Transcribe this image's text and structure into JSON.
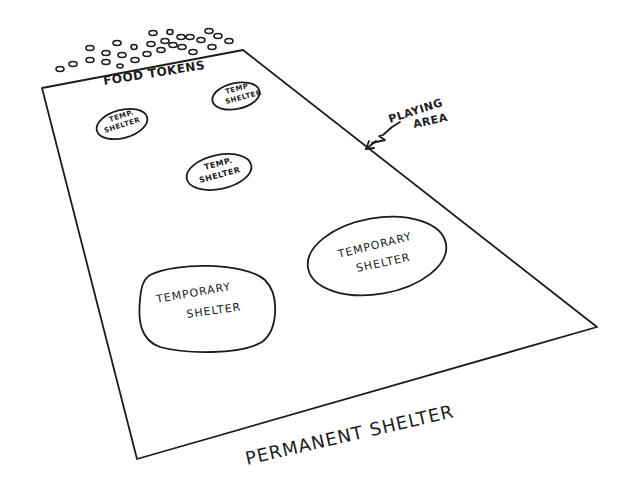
{
  "diagram": {
    "type": "hand-drawn game layout sketch",
    "ink_color": "#1c1c1c",
    "background_color": "#ffffff",
    "labels": {
      "food_tokens": "FOOD TOKENS",
      "playing_area_line1": "PLAYING",
      "playing_area_line2": "AREA",
      "permanent_shelter": "PERMANENT SHELTER"
    },
    "playing_area": {
      "corners": {
        "top_left": [
          42,
          88
        ],
        "top_right": [
          243,
          50
        ],
        "bottom_right": [
          597,
          327
        ],
        "bottom_left": [
          137,
          459
        ]
      }
    },
    "shelters": [
      {
        "id": "temp-shelter-small-left",
        "line1": "TEMP.",
        "line2": "SHELTER",
        "size": "small"
      },
      {
        "id": "temp-shelter-small-right",
        "line1": "TEMP",
        "line2": "SHELTER",
        "size": "small"
      },
      {
        "id": "temp-shelter-small-center",
        "line1": "TEMP.",
        "line2": "SHELTER",
        "size": "small"
      },
      {
        "id": "temporary-shelter-large-right",
        "line1": "TEMPORARY",
        "line2": "SHELTER",
        "size": "large"
      },
      {
        "id": "temporary-shelter-large-left",
        "line1": "TEMPORARY",
        "line2": "SHELTER",
        "size": "large"
      }
    ],
    "food_token_count": 27
  }
}
